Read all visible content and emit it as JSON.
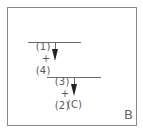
{
  "diagram": {
    "step1": {
      "left": "(1)",
      "op": "+",
      "right": "(4)"
    },
    "step2": {
      "left": "(3)",
      "op": "+",
      "right": "(2)"
    },
    "result": "(C)",
    "panel_label": "B"
  }
}
